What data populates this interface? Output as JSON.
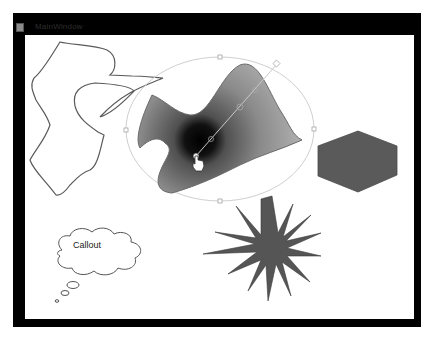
{
  "window": {
    "title": "MainWindow",
    "frame_color": "#000000",
    "client_background": "#ffffff"
  },
  "canvas": {
    "shapes": [
      {
        "type": "freehand-path",
        "name": "Freehand scribble",
        "stroke": "#555555",
        "fill": "none"
      },
      {
        "type": "gradient-blob",
        "name": "Radial gradient shape",
        "selected": true,
        "gradient": {
          "center_color": "#000000",
          "edge_color": "#a0a0a0"
        }
      },
      {
        "type": "hexagon",
        "name": "Hexagon",
        "fill": "#5a5a5a"
      },
      {
        "type": "star",
        "name": "16-point star",
        "points": 16,
        "fill": "#555555"
      },
      {
        "type": "thought-callout",
        "name": "Callout",
        "text": "Callout"
      }
    ],
    "selection": {
      "shape": "ellipse",
      "handles": [
        "top",
        "bottom",
        "left",
        "right"
      ],
      "gradient_line_handles": 4
    }
  },
  "callout": {
    "text": "Callout"
  }
}
